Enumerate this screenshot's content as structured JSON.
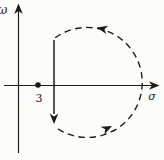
{
  "diagram": {
    "omega_label": "ω",
    "sigma_label": "σ",
    "pole_label": "3"
  },
  "colors": {
    "ink": "#1b1b1b",
    "background": "#fcfcfb"
  }
}
